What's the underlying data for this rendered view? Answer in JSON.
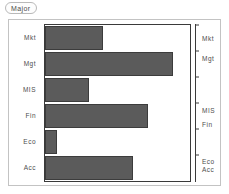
{
  "chip": {
    "label": "Major"
  },
  "axes": {
    "left_labels": [
      "Mkt",
      "Mgt",
      "MIS",
      "Fin",
      "Eco",
      "Acc"
    ],
    "right_labels": [
      "Mkt",
      "Mgt",
      "MIS",
      "Fin",
      "Eco",
      "Acc"
    ]
  },
  "colors": {
    "bar_fill": "#5b5b5b",
    "bar_stroke": "#3c3c3c",
    "frame": "#3a3a3a",
    "card_border": "#c3c3c3",
    "text": "#4d4d4d"
  },
  "chart_data": {
    "type": "bar",
    "orientation": "horizontal",
    "title": "",
    "xlabel": "",
    "ylabel": "Major",
    "categories": [
      "Mkt",
      "Mgt",
      "MIS",
      "Fin",
      "Eco",
      "Acc"
    ],
    "values": [
      40,
      88,
      30,
      71,
      8,
      61
    ],
    "xlim": [
      0,
      100
    ],
    "ylim": null,
    "grid": false,
    "legend": null,
    "right_axis": {
      "labels": [
        "Mkt",
        "Mgt",
        "MIS",
        "Fin",
        "Eco",
        "Acc"
      ],
      "tick_positions_pct": [
        2,
        15,
        48,
        57,
        81,
        86
      ]
    }
  }
}
